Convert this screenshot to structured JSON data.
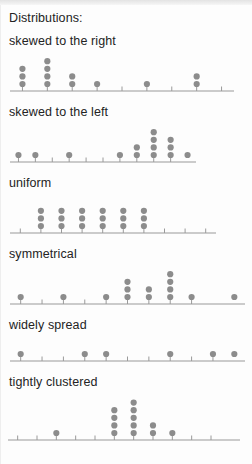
{
  "page": {
    "heading": "Distributions:"
  },
  "colors": {
    "dot": "#8c8c8c",
    "axis": "#9a9a9a",
    "text": "#232323",
    "background": "#fdfdfd"
  },
  "plots": [
    {
      "label": "skewed to the right",
      "axis_ticks": 9,
      "axis_x0": 10,
      "axis_x1": 234,
      "dot_counts": [
        3,
        4,
        2,
        1,
        0,
        1,
        0,
        2,
        0
      ],
      "max_stack": 4
    },
    {
      "label": "skewed to the left",
      "axis_ticks": 10,
      "axis_x0": 10,
      "axis_x1": 196,
      "dot_counts": [
        1,
        1,
        0,
        1,
        0,
        0,
        1,
        2,
        4,
        3,
        1
      ],
      "max_stack": 4
    },
    {
      "label": "uniform",
      "axis_ticks": 10,
      "axis_x0": 10,
      "axis_x1": 216,
      "dot_counts": [
        0,
        3,
        3,
        3,
        3,
        3,
        3,
        0,
        0,
        0
      ],
      "max_stack": 3
    },
    {
      "label": "symmetrical",
      "axis_ticks": 9,
      "axis_x0": 10,
      "axis_x1": 245,
      "dot_counts": [
        1,
        0,
        1,
        0,
        1,
        3,
        2,
        4,
        1,
        0,
        1
      ],
      "max_stack": 4
    },
    {
      "label": "widely spread",
      "axis_ticks": 10,
      "axis_x0": 10,
      "axis_x1": 245,
      "dot_counts": [
        1,
        0,
        0,
        1,
        1,
        0,
        0,
        1,
        0,
        1,
        1
      ],
      "max_stack": 1
    },
    {
      "label": "tightly clustered",
      "axis_ticks": 11,
      "axis_x0": 8,
      "axis_x1": 240,
      "dot_counts": [
        0,
        0,
        1,
        0,
        0,
        4,
        5,
        2,
        1,
        0,
        0,
        0
      ],
      "max_stack": 5
    }
  ],
  "chart_data": {
    "type": "scatter",
    "title": "Distributions:",
    "xlabel": "",
    "ylabel": "count",
    "grid": false,
    "legend": "none",
    "charts": [
      {
        "type": "scatter",
        "title": "skewed to the right",
        "x": [
          1,
          2,
          3,
          4,
          6,
          8
        ],
        "counts": [
          3,
          4,
          2,
          1,
          1,
          2
        ],
        "values": [
          1,
          1,
          1,
          2,
          2,
          2,
          2,
          3,
          3,
          4,
          6,
          8,
          8
        ],
        "n": 13,
        "xlim": [
          0,
          9
        ],
        "tick_count": 9
      },
      {
        "type": "scatter",
        "title": "skewed to the left",
        "x": [
          1,
          2,
          4,
          7,
          8,
          9,
          10,
          11
        ],
        "counts": [
          1,
          1,
          1,
          1,
          2,
          4,
          3,
          1
        ],
        "values": [
          1,
          2,
          4,
          7,
          8,
          8,
          9,
          9,
          9,
          9,
          10,
          10,
          10,
          11
        ],
        "n": 14,
        "xlim": [
          0,
          11
        ],
        "tick_count": 10
      },
      {
        "type": "scatter",
        "title": "uniform",
        "x": [
          2,
          3,
          4,
          5,
          6,
          7
        ],
        "counts": [
          3,
          3,
          3,
          3,
          3,
          3
        ],
        "values": [
          2,
          2,
          2,
          3,
          3,
          3,
          4,
          4,
          4,
          5,
          5,
          5,
          6,
          6,
          6,
          7,
          7,
          7
        ],
        "n": 18,
        "xlim": [
          0,
          10
        ],
        "tick_count": 10
      },
      {
        "type": "scatter",
        "title": "symmetrical",
        "x": [
          1,
          3,
          5,
          6,
          7,
          8,
          9,
          11
        ],
        "counts": [
          1,
          1,
          1,
          3,
          2,
          4,
          1,
          1
        ],
        "values": [
          1,
          3,
          5,
          6,
          6,
          6,
          7,
          7,
          8,
          8,
          8,
          8,
          9,
          11
        ],
        "n": 14,
        "xlim": [
          0,
          11
        ],
        "tick_count": 9
      },
      {
        "type": "scatter",
        "title": "widely spread",
        "x": [
          1,
          4,
          5,
          8,
          10,
          11
        ],
        "counts": [
          1,
          1,
          1,
          1,
          1,
          1
        ],
        "values": [
          1,
          4,
          5,
          8,
          10,
          11
        ],
        "n": 6,
        "xlim": [
          0,
          11
        ],
        "tick_count": 10
      },
      {
        "type": "scatter",
        "title": "tightly clustered",
        "x": [
          3,
          6,
          7,
          8,
          9
        ],
        "counts": [
          1,
          4,
          5,
          2,
          1
        ],
        "values": [
          3,
          6,
          6,
          6,
          6,
          7,
          7,
          7,
          7,
          7,
          8,
          8,
          9
        ],
        "n": 13,
        "xlim": [
          0,
          12
        ],
        "tick_count": 11
      }
    ]
  }
}
